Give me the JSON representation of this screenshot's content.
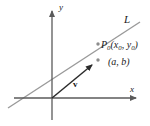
{
  "figure": {
    "background_color": "#ffffff",
    "width": 150,
    "height": 126
  },
  "colors": {
    "axis": "#5a5a5a",
    "line_L": "#9a9a9a",
    "vector": "#2b2b2b",
    "text": "#1a1a1a",
    "point_dot": "#8c8c8c"
  },
  "labels": {
    "line_name": "L",
    "y_axis": "y",
    "x_axis": "x",
    "point_name": "P",
    "point_subscript": "0",
    "point_coords_open": "(",
    "coord_x": "x",
    "coord_x_sub": "0",
    "coord_sep": ", ",
    "coord_y": "y",
    "coord_y_sub": "0",
    "point_coords_close": ")",
    "vector_components": "(a, b)",
    "vector_name": "v"
  },
  "geometry": {
    "origin": {
      "x": 52,
      "y": 98
    },
    "y_axis": {
      "x1": 52,
      "y1": 120,
      "x2": 52,
      "y2": 6
    },
    "x_axis": {
      "x1": 14,
      "y1": 98,
      "x2": 140,
      "y2": 98
    },
    "line_L": {
      "x1": 8,
      "y1": 108,
      "x2": 140,
      "y2": 22
    },
    "vector": {
      "x1": 52,
      "y1": 98,
      "x2": 96,
      "y2": 61
    },
    "point_P0": {
      "x": 98,
      "y": 44
    },
    "point_ab": {
      "x": 97,
      "y": 61
    }
  }
}
